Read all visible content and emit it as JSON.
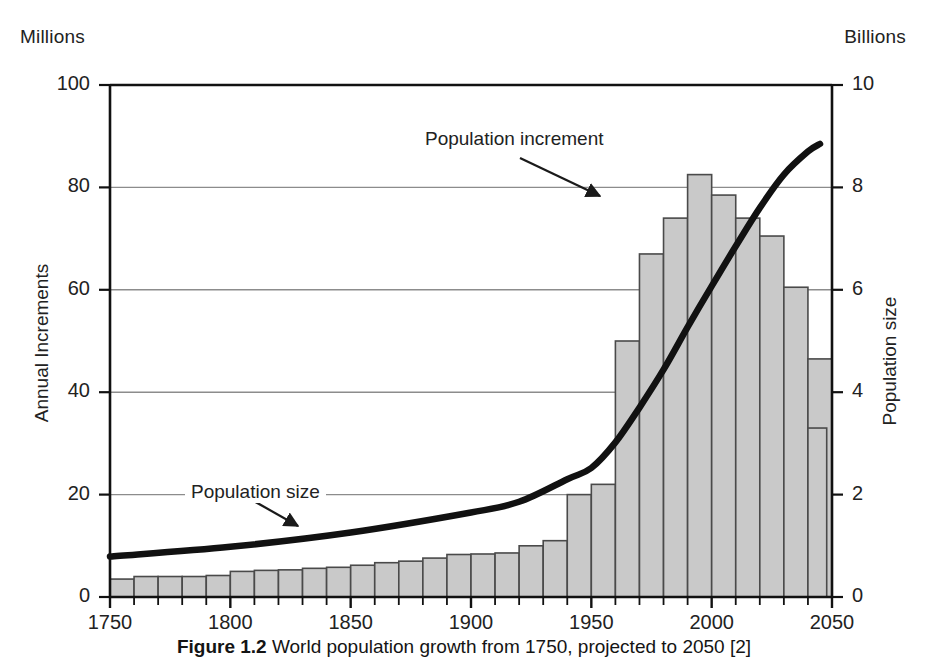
{
  "figure": {
    "caption_bold": "Figure 1.2",
    "caption_rest": "World population growth from 1750, projected to 2050 [2]",
    "unit_left": "Millions",
    "unit_right": "Billions"
  },
  "annotations": {
    "increment": "Population increment",
    "size": "Population size"
  },
  "chart_data": {
    "type": "bar",
    "title": "World population growth from 1750, projected to 2050",
    "xlabel": "",
    "ylabel": "Annual Increments",
    "y2label": "Population size",
    "ylim": [
      0,
      100
    ],
    "y2lim": [
      0,
      10
    ],
    "xlim": [
      1750,
      2050
    ],
    "grid": true,
    "legend_position": "in-plot annotations",
    "y_unit": "Millions",
    "y2_unit": "Billions",
    "yticks": [
      0,
      20,
      40,
      60,
      80,
      100
    ],
    "y2ticks": [
      0,
      2,
      4,
      6,
      8,
      10
    ],
    "xticks": [
      1750,
      1800,
      1850,
      1900,
      1950,
      2000,
      2050
    ],
    "x_minor_tick_step": 10,
    "bar_fill": "#c9c9c9",
    "bar_edge": "#4a4a4a",
    "line_color": "#111111",
    "categories": [
      1750,
      1760,
      1770,
      1780,
      1790,
      1800,
      1810,
      1820,
      1830,
      1840,
      1850,
      1860,
      1870,
      1880,
      1890,
      1900,
      1910,
      1920,
      1930,
      1940,
      1950,
      1960,
      1970,
      1980,
      1990,
      2000,
      2010,
      2020,
      2030,
      2040
    ],
    "series": [
      {
        "name": "Population increment",
        "unit": "Millions per year",
        "axis": "left",
        "type": "bar",
        "values": [
          3.5,
          4.0,
          4.0,
          4.0,
          4.2,
          5.0,
          5.2,
          5.3,
          5.6,
          5.8,
          6.2,
          6.7,
          7.0,
          7.6,
          8.3,
          8.4,
          8.6,
          10.0,
          11.0,
          20.0,
          22.0,
          50.0,
          67.0,
          74.0,
          82.5,
          78.5,
          74.0,
          70.5,
          60.5,
          46.5
        ]
      },
      {
        "name": "Population size",
        "unit": "Billions",
        "axis": "right",
        "type": "line",
        "x": [
          1750,
          1800,
          1850,
          1900,
          1920,
          1940,
          1950,
          1960,
          1970,
          1980,
          1990,
          2000,
          2010,
          2020,
          2030,
          2040,
          2045
        ],
        "values": [
          0.79,
          0.98,
          1.26,
          1.65,
          1.86,
          2.3,
          2.52,
          3.02,
          3.7,
          4.44,
          5.27,
          6.07,
          6.85,
          7.6,
          8.25,
          8.7,
          8.85
        ]
      }
    ],
    "extra_bar": {
      "year": 2040,
      "value": 33.0,
      "note": "final bar"
    }
  }
}
